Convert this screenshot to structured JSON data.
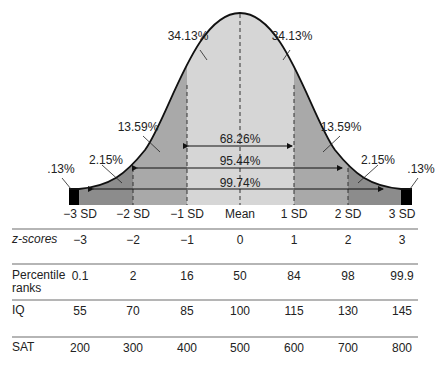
{
  "chart_data": {
    "type": "area",
    "x": [
      "-3 SD",
      "-2 SD",
      "-1 SD",
      "Mean",
      "1 SD",
      "2 SD",
      "3 SD"
    ],
    "regions": [
      {
        "range": [
          "<-3 SD"
        ],
        "percent": ".13%"
      },
      {
        "range": [
          "-3 SD",
          "-2 SD"
        ],
        "percent": "2.15%"
      },
      {
        "range": [
          "-2 SD",
          "-1 SD"
        ],
        "percent": "13.59%"
      },
      {
        "range": [
          "-1 SD",
          "Mean"
        ],
        "percent": "34.13%"
      },
      {
        "range": [
          "Mean",
          "1 SD"
        ],
        "percent": "34.13%"
      },
      {
        "range": [
          "1 SD",
          "2 SD"
        ],
        "percent": "13.59%"
      },
      {
        "range": [
          "2 SD",
          "3 SD"
        ],
        "percent": "2.15%"
      },
      {
        "range": [
          ">3 SD"
        ],
        "percent": ".13%"
      }
    ],
    "spans": [
      {
        "range": [
          "-1 SD",
          "1 SD"
        ],
        "percent": "68.26%"
      },
      {
        "range": [
          "-2 SD",
          "2 SD"
        ],
        "percent": "95.44%"
      },
      {
        "range": [
          "-3 SD",
          "3 SD"
        ],
        "percent": "99.74%"
      }
    ],
    "colors": {
      "center": "#d6d6d6",
      "inner": "#a9a9a9",
      "outer": "#8c8c8c",
      "tail": "#000000",
      "curve": "#111111"
    }
  },
  "labels": {
    "pct_034_left": "34.13%",
    "pct_034_right": "34.13%",
    "pct_1359_left": "13.59%",
    "pct_1359_right": "13.59%",
    "pct_215_left": "2.15%",
    "pct_215_right": "2.15%",
    "pct_013_left": ".13%",
    "pct_013_right": ".13%",
    "span_68": "68.26%",
    "span_95": "95.44%",
    "span_99": "99.74%"
  },
  "axis": [
    "−3 SD",
    "−2 SD",
    "−1 SD",
    "Mean",
    "1 SD",
    "2 SD",
    "3 SD"
  ],
  "table": {
    "rows": [
      {
        "label": "z-scores",
        "values": [
          "−3",
          "−2",
          "−1",
          "0",
          "1",
          "2",
          "3"
        ]
      },
      {
        "label": "Percentile ranks",
        "label_line1": "Percentile",
        "label_line2": "ranks",
        "values": [
          "0.1",
          "2",
          "16",
          "50",
          "84",
          "98",
          "99.9"
        ]
      },
      {
        "label": "IQ",
        "values": [
          "55",
          "70",
          "85",
          "100",
          "115",
          "130",
          "145"
        ]
      },
      {
        "label": "SAT",
        "values": [
          "200",
          "300",
          "400",
          "500",
          "600",
          "700",
          "800"
        ]
      }
    ]
  }
}
